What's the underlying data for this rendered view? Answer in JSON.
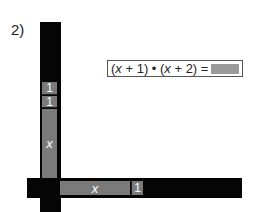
{
  "problem_label": "2)",
  "equation": {
    "text": "(x + 1) • (x + 2) =",
    "part1": "(",
    "var1": "x",
    "part2": " + 1) • (",
    "var2": "x",
    "part3": " + 2) ="
  },
  "vertical_bar": {
    "segments": [
      {
        "label": "1"
      },
      {
        "label": "1"
      },
      {
        "label": "x"
      }
    ]
  },
  "horizontal_bar": {
    "segments": [
      {
        "label": "x"
      },
      {
        "label": "1"
      }
    ]
  },
  "colors": {
    "bar": "#050505",
    "segment": "#7a7a7a",
    "answer_box": "#9a9a9a"
  }
}
